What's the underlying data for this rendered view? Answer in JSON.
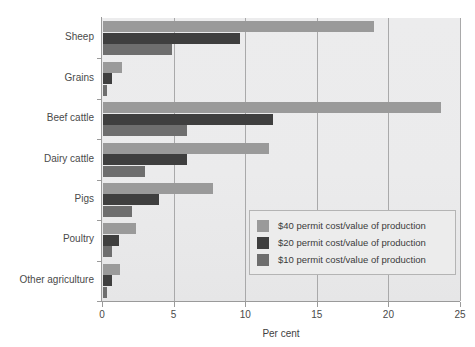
{
  "figure": {
    "title_clipped": "",
    "background": "#ffffff",
    "plot_background": "#ebebec"
  },
  "chart_data": {
    "type": "bar",
    "orientation": "horizontal",
    "title": "",
    "xlabel": "Per cent",
    "ylabel": "",
    "xlim": [
      0,
      25
    ],
    "xticks": [
      0,
      5,
      10,
      15,
      20,
      25
    ],
    "xtick_labels": [
      "0",
      "5",
      "10",
      "15",
      "20",
      "25"
    ],
    "grid": "vertical",
    "legend_position": "center-right-inside",
    "categories": [
      "Sheep",
      "Grains",
      "Beef cattle",
      "Dairy cattle",
      "Pigs",
      "Poultry",
      "Other agriculture"
    ],
    "series": [
      {
        "name": "$40 permit cost/value of production",
        "color": "#9a9a9a",
        "values": [
          18.9,
          1.3,
          23.6,
          11.6,
          7.7,
          2.3,
          1.2
        ]
      },
      {
        "name": "$20 permit cost/value of production",
        "color": "#3f3f3f",
        "values": [
          9.6,
          0.6,
          11.9,
          5.9,
          3.9,
          1.1,
          0.6
        ]
      },
      {
        "name": "$10 permit cost/value of production",
        "color": "#6e6e6e",
        "values": [
          4.8,
          0.3,
          5.9,
          2.9,
          2.0,
          0.6,
          0.3
        ]
      }
    ]
  },
  "legend": {
    "items": [
      {
        "label": "$40 permit cost/value of production",
        "color": "#9a9a9a"
      },
      {
        "label": "$20 permit cost/value of production",
        "color": "#3f3f3f"
      },
      {
        "label": "$10 permit cost/value of production",
        "color": "#6e6e6e"
      }
    ]
  }
}
